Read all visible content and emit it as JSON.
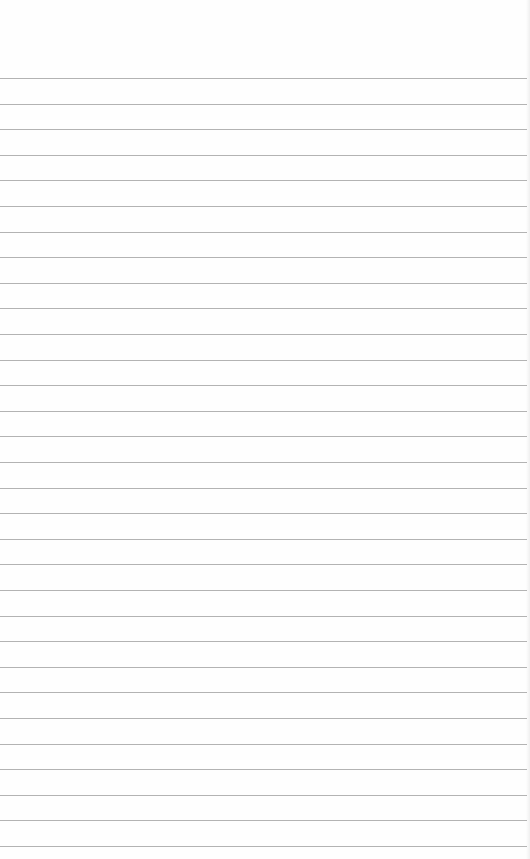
{
  "page": {
    "type": "ruled-notepad-sheet",
    "background_color": "#fefefe",
    "rule_color": "#9a9a9a",
    "rule_count": 31,
    "first_rule_y": 78,
    "rule_spacing_px": 25.6
  },
  "header": {
    "text": ""
  },
  "lines": []
}
